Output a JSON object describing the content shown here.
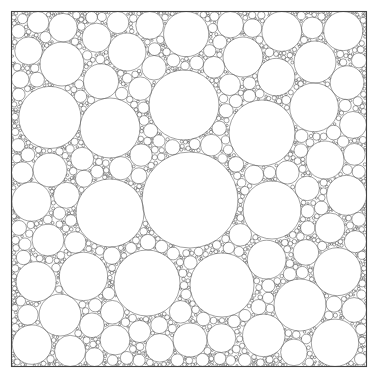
{
  "figure": {
    "type": "circle-packing-diagram",
    "width": 378,
    "height": 390,
    "background_color": "#ffffff",
    "stroke_color": "#555555",
    "stroke_width": 0.55,
    "fill_color": "none"
  },
  "frame": {
    "name": "bounding-square",
    "x": 11.5,
    "y": 11.5,
    "width": 355,
    "height": 355,
    "stroke_color": "#444444",
    "stroke_width": 1.1
  },
  "packing": {
    "description": "Apollonian-style greedy circle packing filling a square; circles are mutually tangent and recursively fill residual gaps with ever smaller circles down to a minimum radius.",
    "min_radius": 0.85,
    "max_radius": 48,
    "total_circles_approx": 1400,
    "generation": {
      "mode": "greedy-gap-fill",
      "seed": 20250614,
      "candidate_samples": 2600,
      "shrink_passes": 9
    },
    "seed_circles": [
      {
        "cx": 190.0,
        "cy": 200.0,
        "r": 48.0
      },
      {
        "cx": 184.0,
        "cy": 105.0,
        "r": 35.0
      },
      {
        "cx": 110.0,
        "cy": 213.0,
        "r": 34.0
      },
      {
        "cx": 262.0,
        "cy": 133.0,
        "r": 33.0
      },
      {
        "cx": 147.0,
        "cy": 283.0,
        "r": 33.0
      },
      {
        "cx": 222.0,
        "cy": 285.0,
        "r": 32.0
      },
      {
        "cx": 272.0,
        "cy": 210.0,
        "r": 29.0
      },
      {
        "cx": 110.0,
        "cy": 128.0,
        "r": 30.0
      },
      {
        "cx": 62.0,
        "cy": 64.0,
        "r": 22.0
      },
      {
        "cx": 315.0,
        "cy": 62.0,
        "r": 21.0
      },
      {
        "cx": 60.0,
        "cy": 315.0,
        "r": 21.0
      },
      {
        "cx": 300.0,
        "cy": 305.0,
        "r": 26.0
      },
      {
        "cx": 243.0,
        "cy": 57.0,
        "r": 20.0
      },
      {
        "cx": 127.0,
        "cy": 52.0,
        "r": 19.0
      },
      {
        "cx": 325.0,
        "cy": 160.0,
        "r": 19.0
      },
      {
        "cx": 50.0,
        "cy": 170.0,
        "r": 17.0
      },
      {
        "cx": 48.0,
        "cy": 240.0,
        "r": 16.0
      },
      {
        "cx": 190.0,
        "cy": 340.0,
        "r": 17.0
      },
      {
        "cx": 330.0,
        "cy": 228.0,
        "r": 15.0
      },
      {
        "cx": 115.0,
        "cy": 340.0,
        "r": 15.0
      }
    ]
  },
  "legend": {
    "visible": false,
    "entries": []
  },
  "labels": {
    "visible": false,
    "items": []
  }
}
